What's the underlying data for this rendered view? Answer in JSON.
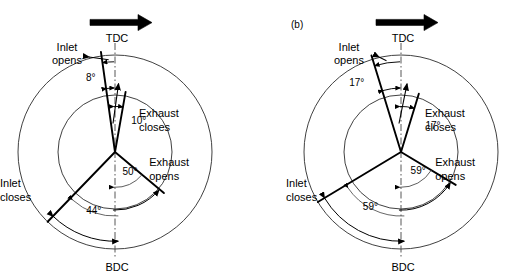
{
  "figure": {
    "type": "valve-timing-diagram",
    "background": "#ffffff",
    "line_color": "#000000",
    "thin_line_color": "#3a3a3a",
    "width": 511,
    "height": 280
  },
  "panels": [
    {
      "tag": "",
      "center": {
        "x": 115,
        "y": 152
      },
      "inner_radius": 57,
      "outer_radius": 97,
      "rotation_arrow": {
        "name": "rotation-arrow",
        "direction": "clockwise",
        "x1": 90,
        "x2": 152,
        "y": 22
      },
      "markers": {
        "tdc": "TDC",
        "bdc": "BDC"
      },
      "events": [
        {
          "name": "inlet-opens",
          "label": "Inlet\nopens",
          "label_line1": "Inlet",
          "label_line2": "opens",
          "angle_deg": 8,
          "angle_label": "8°",
          "side": "before-tdc",
          "radius_frac": 1.0
        },
        {
          "name": "exhaust-closes",
          "label": "Exhaust\ncloses",
          "label_line1": "Exhaust",
          "label_line2": "closes",
          "angle_deg": 10,
          "angle_label": "10°",
          "side": "after-tdc",
          "radius_frac": 0.78
        },
        {
          "name": "exhaust-opens",
          "label": "Exhaust\nopens",
          "label_line1": "Exhaust",
          "label_line2": "opens",
          "angle_deg": 50,
          "angle_label": "50°",
          "side": "before-bdc",
          "radius_frac": 0.78
        },
        {
          "name": "inlet-closes",
          "label": "Inlet\ncloses",
          "label_line1": "Inlet",
          "label_line2": "closes",
          "angle_deg": 44,
          "angle_label": "44°",
          "side": "after-bdc",
          "radius_frac": 1.0
        }
      ]
    },
    {
      "tag": "(b)",
      "center": {
        "x": 401,
        "y": 152
      },
      "inner_radius": 57,
      "outer_radius": 97,
      "rotation_arrow": {
        "name": "rotation-arrow",
        "direction": "clockwise",
        "x1": 376,
        "x2": 438,
        "y": 22
      },
      "markers": {
        "tdc": "TDC",
        "bdc": "BDC"
      },
      "events": [
        {
          "name": "inlet-opens",
          "label": "Inlet\nopens",
          "label_line1": "Inlet",
          "label_line2": "opens",
          "angle_deg": 17,
          "angle_label": "17°",
          "side": "before-tdc",
          "radius_frac": 1.0
        },
        {
          "name": "exhaust-closes",
          "label": "Exhaust\ncloses",
          "label_line1": "Exhaust",
          "label_line2": "closes",
          "angle_deg": 17,
          "angle_label": "17°",
          "side": "after-tdc",
          "radius_frac": 0.78
        },
        {
          "name": "exhaust-opens",
          "label": "Exhaust\nopens",
          "label_line1": "Exhaust",
          "label_line2": "opens",
          "angle_deg": 59,
          "angle_label": "59°",
          "side": "before-bdc",
          "radius_frac": 0.78
        },
        {
          "name": "inlet-closes",
          "label": "Inlet\ncloses",
          "label_line1": "Inlet",
          "label_line2": "closes",
          "angle_deg": 59,
          "angle_label": "59°",
          "side": "after-bdc",
          "radius_frac": 1.0
        }
      ]
    }
  ],
  "chart_data": {
    "type": "diagram",
    "title": "",
    "diagrams": [
      {
        "panel": "a",
        "inlet_opens_btdc_deg": 8,
        "exhaust_closes_atdc_deg": 10,
        "exhaust_opens_bbdc_deg": 50,
        "inlet_closes_abdc_deg": 44
      },
      {
        "panel": "b",
        "inlet_opens_btdc_deg": 17,
        "exhaust_closes_atdc_deg": 17,
        "exhaust_opens_bbdc_deg": 59,
        "inlet_closes_abdc_deg": 59
      }
    ]
  }
}
